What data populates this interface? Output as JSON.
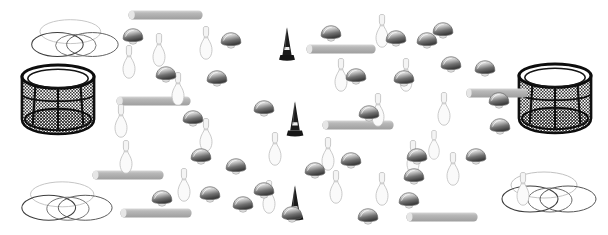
{
  "scene": {
    "title": "Scattered Objects Scene",
    "width": 608,
    "height": 235,
    "background_color": "#ffffff",
    "object_classes": [
      {
        "name": "bowling-pin",
        "label": "Bowling pin",
        "count": 22,
        "color": "#e8e8e8",
        "outline_color": "#b4b4b4"
      },
      {
        "name": "mushroom-cap",
        "label": "Mushroom cap",
        "count": 31,
        "color": "#bdbdbd",
        "outline_color": "#6e6e6e"
      },
      {
        "name": "traffic-cone",
        "label": "Traffic cone",
        "count": 3,
        "color": "#1a1a1a",
        "band_color": "#f0f0f0"
      },
      {
        "name": "gray-bar",
        "label": "Gray rounded bar",
        "count": 8,
        "color": "#b0b0b0",
        "highlight_color": "#dedede"
      },
      {
        "name": "mesh-basket",
        "label": "Black mesh basket",
        "count": 2,
        "color": "#111111",
        "mesh_color": "#555555"
      },
      {
        "name": "hoop-rings",
        "label": "Overlapping hoop rings",
        "count": 3,
        "color": "#8a8a8a"
      }
    ],
    "objects": [
      {
        "type": "hoop-rings",
        "x": 28,
        "y": 16,
        "w": 92,
        "h": 46,
        "scale": 1.0
      },
      {
        "type": "hoop-rings",
        "x": 16,
        "y": 178,
        "w": 100,
        "h": 48,
        "scale": 1.05
      },
      {
        "type": "hoop-rings",
        "x": 498,
        "y": 168,
        "w": 100,
        "h": 50,
        "scale": 1.05
      },
      {
        "type": "mesh-basket",
        "x": 16,
        "y": 63,
        "w": 84,
        "h": 74
      },
      {
        "type": "mesh-basket",
        "x": 512,
        "y": 62,
        "w": 86,
        "h": 74
      },
      {
        "type": "gray-bar",
        "x": 128,
        "y": 10,
        "w": 75,
        "h": 10
      },
      {
        "type": "gray-bar",
        "x": 306,
        "y": 44,
        "w": 70,
        "h": 10
      },
      {
        "type": "gray-bar",
        "x": 116,
        "y": 96,
        "w": 75,
        "h": 10
      },
      {
        "type": "gray-bar",
        "x": 322,
        "y": 120,
        "w": 72,
        "h": 10
      },
      {
        "type": "gray-bar",
        "x": 466,
        "y": 88,
        "w": 62,
        "h": 10
      },
      {
        "type": "gray-bar",
        "x": 92,
        "y": 170,
        "w": 72,
        "h": 10
      },
      {
        "type": "gray-bar",
        "x": 120,
        "y": 208,
        "w": 72,
        "h": 10
      },
      {
        "type": "gray-bar",
        "x": 406,
        "y": 212,
        "w": 72,
        "h": 10
      },
      {
        "type": "traffic-cone",
        "x": 274,
        "y": 26,
        "w": 26,
        "h": 36
      },
      {
        "type": "traffic-cone",
        "x": 282,
        "y": 100,
        "w": 26,
        "h": 38
      },
      {
        "type": "traffic-cone",
        "x": 282,
        "y": 184,
        "w": 26,
        "h": 38
      },
      {
        "type": "bowling-pin",
        "x": 119,
        "y": 45,
        "w": 20,
        "h": 34
      },
      {
        "type": "bowling-pin",
        "x": 149,
        "y": 33,
        "w": 20,
        "h": 34
      },
      {
        "type": "bowling-pin",
        "x": 196,
        "y": 26,
        "w": 20,
        "h": 34
      },
      {
        "type": "bowling-pin",
        "x": 168,
        "y": 72,
        "w": 20,
        "h": 34
      },
      {
        "type": "bowling-pin",
        "x": 111,
        "y": 104,
        "w": 20,
        "h": 34
      },
      {
        "type": "bowling-pin",
        "x": 196,
        "y": 118,
        "w": 20,
        "h": 34
      },
      {
        "type": "bowling-pin",
        "x": 331,
        "y": 58,
        "w": 20,
        "h": 34
      },
      {
        "type": "bowling-pin",
        "x": 372,
        "y": 14,
        "w": 20,
        "h": 34
      },
      {
        "type": "bowling-pin",
        "x": 396,
        "y": 58,
        "w": 20,
        "h": 34
      },
      {
        "type": "bowling-pin",
        "x": 434,
        "y": 92,
        "w": 20,
        "h": 34
      },
      {
        "type": "bowling-pin",
        "x": 368,
        "y": 93,
        "w": 20,
        "h": 34
      },
      {
        "type": "bowling-pin",
        "x": 318,
        "y": 137,
        "w": 20,
        "h": 34
      },
      {
        "type": "bowling-pin",
        "x": 403,
        "y": 140,
        "w": 20,
        "h": 34
      },
      {
        "type": "bowling-pin",
        "x": 443,
        "y": 152,
        "w": 20,
        "h": 34
      },
      {
        "type": "bowling-pin",
        "x": 326,
        "y": 170,
        "w": 20,
        "h": 34
      },
      {
        "type": "bowling-pin",
        "x": 372,
        "y": 172,
        "w": 20,
        "h": 34
      },
      {
        "type": "bowling-pin",
        "x": 116,
        "y": 140,
        "w": 20,
        "h": 34
      },
      {
        "type": "bowling-pin",
        "x": 174,
        "y": 168,
        "w": 20,
        "h": 34
      },
      {
        "type": "bowling-pin",
        "x": 259,
        "y": 180,
        "w": 20,
        "h": 34
      },
      {
        "type": "bowling-pin",
        "x": 265,
        "y": 132,
        "w": 20,
        "h": 34
      },
      {
        "type": "bowling-pin",
        "x": 513,
        "y": 172,
        "w": 20,
        "h": 34
      },
      {
        "type": "bowling-pin",
        "x": 425,
        "y": 130,
        "w": 18,
        "h": 30
      },
      {
        "type": "mushroom-cap",
        "x": 122,
        "y": 28,
        "w": 22,
        "h": 17
      },
      {
        "type": "mushroom-cap",
        "x": 155,
        "y": 66,
        "w": 22,
        "h": 17
      },
      {
        "type": "mushroom-cap",
        "x": 182,
        "y": 110,
        "w": 22,
        "h": 17
      },
      {
        "type": "mushroom-cap",
        "x": 206,
        "y": 70,
        "w": 22,
        "h": 17
      },
      {
        "type": "mushroom-cap",
        "x": 220,
        "y": 32,
        "w": 22,
        "h": 17
      },
      {
        "type": "mushroom-cap",
        "x": 190,
        "y": 148,
        "w": 22,
        "h": 17
      },
      {
        "type": "mushroom-cap",
        "x": 199,
        "y": 186,
        "w": 22,
        "h": 17
      },
      {
        "type": "mushroom-cap",
        "x": 232,
        "y": 196,
        "w": 22,
        "h": 17
      },
      {
        "type": "mushroom-cap",
        "x": 253,
        "y": 182,
        "w": 22,
        "h": 17
      },
      {
        "type": "mushroom-cap",
        "x": 253,
        "y": 100,
        "w": 22,
        "h": 17
      },
      {
        "type": "mushroom-cap",
        "x": 225,
        "y": 158,
        "w": 22,
        "h": 17
      },
      {
        "type": "mushroom-cap",
        "x": 320,
        "y": 25,
        "w": 22,
        "h": 17
      },
      {
        "type": "mushroom-cap",
        "x": 385,
        "y": 30,
        "w": 22,
        "h": 17
      },
      {
        "type": "mushroom-cap",
        "x": 432,
        "y": 22,
        "w": 22,
        "h": 17
      },
      {
        "type": "mushroom-cap",
        "x": 345,
        "y": 68,
        "w": 22,
        "h": 17
      },
      {
        "type": "mushroom-cap",
        "x": 393,
        "y": 70,
        "w": 22,
        "h": 17
      },
      {
        "type": "mushroom-cap",
        "x": 440,
        "y": 56,
        "w": 22,
        "h": 17
      },
      {
        "type": "mushroom-cap",
        "x": 358,
        "y": 105,
        "w": 22,
        "h": 17
      },
      {
        "type": "mushroom-cap",
        "x": 406,
        "y": 148,
        "w": 22,
        "h": 17
      },
      {
        "type": "mushroom-cap",
        "x": 357,
        "y": 208,
        "w": 22,
        "h": 17
      },
      {
        "type": "mushroom-cap",
        "x": 398,
        "y": 192,
        "w": 22,
        "h": 17
      },
      {
        "type": "mushroom-cap",
        "x": 403,
        "y": 168,
        "w": 22,
        "h": 17
      },
      {
        "type": "mushroom-cap",
        "x": 465,
        "y": 148,
        "w": 22,
        "h": 17
      },
      {
        "type": "mushroom-cap",
        "x": 489,
        "y": 118,
        "w": 22,
        "h": 17
      },
      {
        "type": "mushroom-cap",
        "x": 488,
        "y": 92,
        "w": 22,
        "h": 17
      },
      {
        "type": "mushroom-cap",
        "x": 474,
        "y": 60,
        "w": 22,
        "h": 17
      },
      {
        "type": "mushroom-cap",
        "x": 416,
        "y": 32,
        "w": 22,
        "h": 17
      },
      {
        "type": "mushroom-cap",
        "x": 304,
        "y": 162,
        "w": 22,
        "h": 17
      },
      {
        "type": "mushroom-cap",
        "x": 340,
        "y": 152,
        "w": 22,
        "h": 17
      },
      {
        "type": "mushroom-cap",
        "x": 151,
        "y": 190,
        "w": 22,
        "h": 17
      },
      {
        "type": "mushroom-cap",
        "x": 281,
        "y": 206,
        "w": 22,
        "h": 17
      }
    ]
  }
}
